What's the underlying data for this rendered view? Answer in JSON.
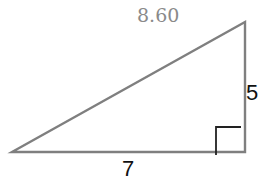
{
  "diagram": {
    "type": "right-triangle",
    "labels": {
      "hypotenuse": "8.60",
      "vertical_leg": "5",
      "horizontal_leg": "7"
    },
    "colors": {
      "stroke": "#7f7f7f",
      "right_angle_marker": "#222222",
      "hypotenuse_label": "#8a8a8a",
      "leg_labels": "#111111"
    },
    "right_angle_marker": true
  }
}
